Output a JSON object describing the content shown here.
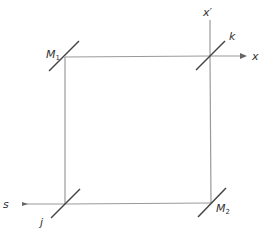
{
  "diagram": {
    "colors": {
      "beam": "#9a9a9a",
      "mirror": "#444444",
      "text": "#333333"
    },
    "labels": {
      "m1": "M",
      "m1_sub": "1",
      "m2": "M",
      "m2_sub": "2",
      "k": "k",
      "j": "j",
      "s": "s",
      "x": "x",
      "x_prime": "x′"
    }
  }
}
